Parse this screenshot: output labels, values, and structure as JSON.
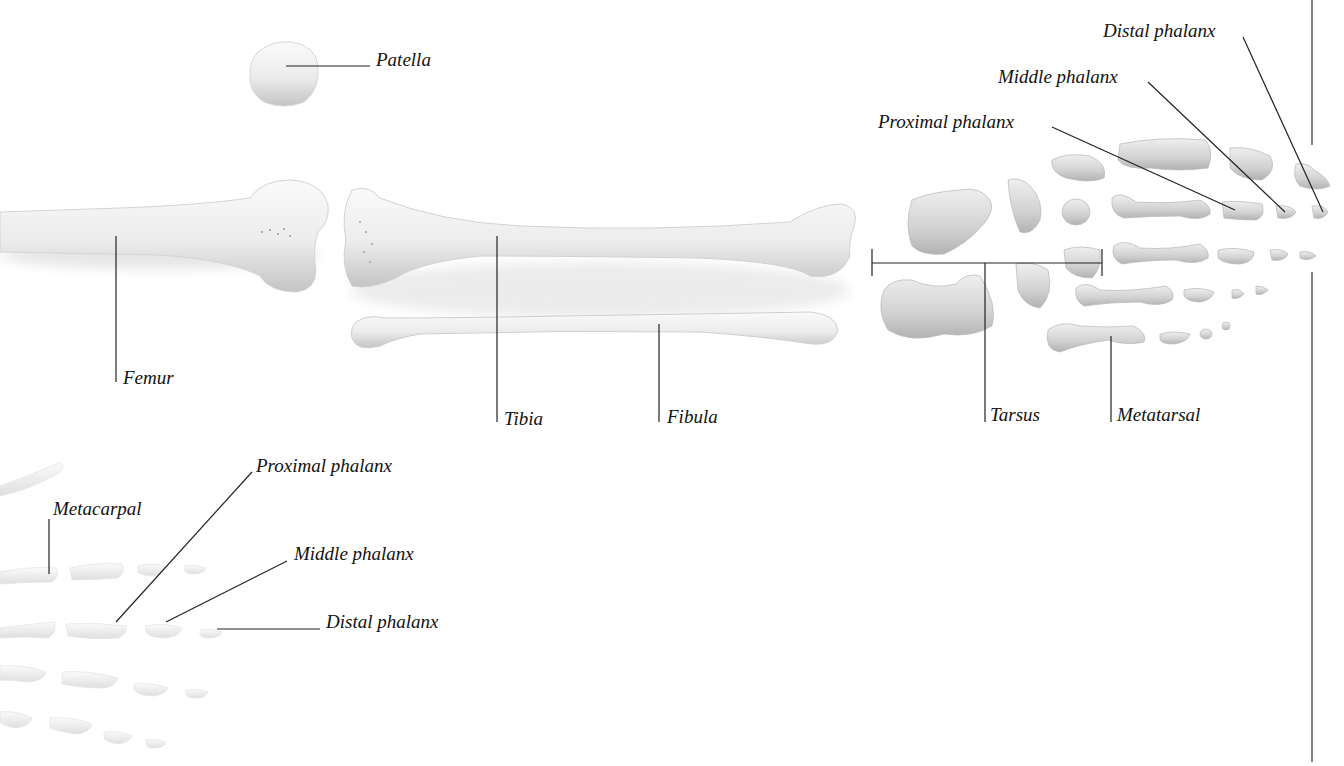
{
  "diagram": {
    "colors": {
      "background": "#ffffff",
      "leader_line": "#222222",
      "bone_light": "#f4f4f4",
      "bone_mid": "#d6d6d6",
      "bone_shadow": "#a9a9a9",
      "text": "#111111"
    },
    "labels": {
      "patella": "Patella",
      "femur": "Femur",
      "tibia": "Tibia",
      "fibula": "Fibula",
      "tarsus": "Tarsus",
      "metatarsal": "Metatarsal",
      "foot_proximal_phalanx": "Proximal phalanx",
      "foot_middle_phalanx": "Middle phalanx",
      "foot_distal_phalanx": "Distal phalanx",
      "metacarpal": "Metacarpal",
      "hand_proximal_phalanx": "Proximal phalanx",
      "hand_middle_phalanx": "Middle phalanx",
      "hand_distal_phalanx": "Distal phalanx"
    }
  }
}
